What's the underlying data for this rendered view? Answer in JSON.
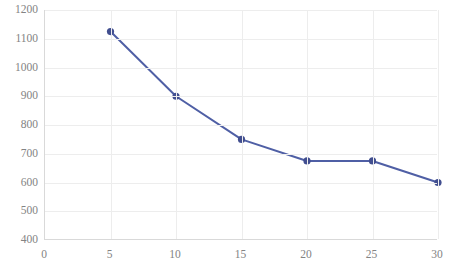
{
  "chart_data": {
    "type": "line",
    "title": "",
    "xlabel": "",
    "ylabel": "",
    "x": [
      5,
      10,
      15,
      20,
      25,
      30
    ],
    "values": [
      1125,
      900,
      750,
      675,
      675,
      600
    ],
    "series": [
      {
        "name": "Series 1",
        "x": [
          5,
          10,
          15,
          20,
          25,
          30
        ],
        "values": [
          1125,
          900,
          750,
          675,
          675,
          600
        ]
      }
    ],
    "xlim": [
      0,
      30
    ],
    "ylim": [
      400,
      1200
    ],
    "xticks": [
      0,
      5,
      10,
      15,
      20,
      25,
      30
    ],
    "yticks": [
      400,
      500,
      600,
      700,
      800,
      900,
      1000,
      1100,
      1200
    ],
    "xtick_labels": [
      "0",
      "5",
      "10",
      "15",
      "20",
      "25",
      "30"
    ],
    "ytick_labels": [
      "400",
      "500",
      "600",
      "700",
      "800",
      "900",
      "1000",
      "1100",
      "1200"
    ],
    "grid": true,
    "legend": false,
    "marker": "circle",
    "colors": {
      "line": "#4F5FA5",
      "marker": "#414E8F",
      "grid": "#ededed",
      "axis": "#d9d9d9",
      "tick_label": "#838383",
      "background": "#ffffff"
    }
  }
}
